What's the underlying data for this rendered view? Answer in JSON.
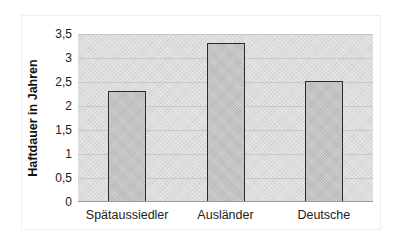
{
  "chart_data": {
    "type": "bar",
    "title": "",
    "xlabel": "",
    "ylabel": "Haftdauer in Jahren",
    "categories": [
      "Spätaussiedler",
      "Ausländer",
      "Deutsche"
    ],
    "values": [
      2.3,
      3.3,
      2.5
    ],
    "ylim": [
      0,
      3.5
    ],
    "yticks": [
      "0",
      "0,5",
      "1",
      "1,5",
      "2",
      "2,5",
      "3",
      "3,5"
    ],
    "ytick_values": [
      0,
      0.5,
      1,
      1.5,
      2,
      2.5,
      3,
      3.5
    ],
    "grid": true,
    "legend": null,
    "colors": {
      "plot_background": "#dedede",
      "bar_fill": "#c6c6c6",
      "bar_border": "#2a2a2a",
      "gridline": "#c8c8c8"
    }
  }
}
